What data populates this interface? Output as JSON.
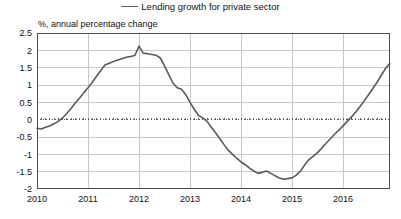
{
  "legend": {
    "swatch_name": "legend-line-swatch",
    "label": "Lending growth for private sector",
    "line_color": "#5a5a5a"
  },
  "axis_subtitle": "%, annual percentage change",
  "colors": {
    "series": "#5a5a5a",
    "grid": "#c8c8c8",
    "frame": "#4d4d4d",
    "zero_line": "#555555",
    "text": "#111111",
    "background": "#ffffff"
  },
  "chart_data": {
    "type": "line",
    "title": "",
    "subtitle": "%, annual percentage change",
    "xlabel": "",
    "ylabel": "%, annual percentage change",
    "ylim": [
      -2,
      2.5
    ],
    "xlim": [
      2010,
      2016.92
    ],
    "ytick_labels": [
      "2.5",
      "2",
      "1.5",
      "1",
      "0.5",
      "0",
      "-0.5",
      "-1",
      "-1.5",
      "-2"
    ],
    "yticks": [
      2.5,
      2,
      1.5,
      1,
      0.5,
      0,
      -0.5,
      -1,
      -1.5,
      -2
    ],
    "xtick_labels": [
      "2010",
      "2011",
      "2012",
      "2013",
      "2014",
      "2015",
      "2016"
    ],
    "xticks": [
      2010,
      2011,
      2012,
      2013,
      2014,
      2015,
      2016
    ],
    "grid": true,
    "zero_line": true,
    "zero_line_style": "dotted",
    "legend_position": "top-center",
    "series": [
      {
        "name": "Lending growth for private sector",
        "color": "#5a5a5a",
        "x": [
          2010.0,
          2010.083,
          2010.167,
          2010.25,
          2010.333,
          2010.417,
          2010.5,
          2010.583,
          2010.667,
          2010.75,
          2010.833,
          2010.917,
          2011.0,
          2011.083,
          2011.167,
          2011.25,
          2011.333,
          2011.417,
          2011.5,
          2011.583,
          2011.667,
          2011.75,
          2011.833,
          2011.917,
          2012.0,
          2012.083,
          2012.167,
          2012.25,
          2012.333,
          2012.417,
          2012.5,
          2012.583,
          2012.667,
          2012.75,
          2012.833,
          2012.917,
          2013.0,
          2013.083,
          2013.167,
          2013.25,
          2013.333,
          2013.417,
          2013.5,
          2013.583,
          2013.667,
          2013.75,
          2013.833,
          2013.917,
          2014.0,
          2014.083,
          2014.167,
          2014.25,
          2014.333,
          2014.417,
          2014.5,
          2014.583,
          2014.667,
          2014.75,
          2014.833,
          2014.917,
          2015.0,
          2015.083,
          2015.167,
          2015.25,
          2015.333,
          2015.417,
          2015.5,
          2015.583,
          2015.667,
          2015.75,
          2015.833,
          2015.917,
          2016.0,
          2016.083,
          2016.167,
          2016.25,
          2016.333,
          2016.417,
          2016.5,
          2016.583,
          2016.667,
          2016.75,
          2016.833,
          2016.917
        ],
        "values": [
          -0.25,
          -0.27,
          -0.22,
          -0.18,
          -0.12,
          -0.05,
          0.05,
          0.18,
          0.32,
          0.48,
          0.62,
          0.78,
          0.92,
          1.08,
          1.25,
          1.42,
          1.58,
          1.63,
          1.68,
          1.72,
          1.76,
          1.8,
          1.82,
          1.85,
          2.12,
          1.92,
          1.9,
          1.88,
          1.86,
          1.78,
          1.55,
          1.3,
          1.05,
          0.92,
          0.88,
          0.72,
          0.5,
          0.3,
          0.12,
          0.05,
          -0.05,
          -0.22,
          -0.38,
          -0.55,
          -0.72,
          -0.88,
          -1.0,
          -1.12,
          -1.22,
          -1.3,
          -1.4,
          -1.48,
          -1.55,
          -1.52,
          -1.48,
          -1.55,
          -1.62,
          -1.68,
          -1.72,
          -1.7,
          -1.68,
          -1.6,
          -1.48,
          -1.3,
          -1.15,
          -1.05,
          -0.95,
          -0.82,
          -0.68,
          -0.55,
          -0.42,
          -0.3,
          -0.18,
          -0.05,
          0.08,
          0.22,
          0.38,
          0.55,
          0.72,
          0.9,
          1.08,
          1.28,
          1.48,
          1.62
        ]
      }
    ]
  },
  "plot_geometry": {
    "left": 37,
    "right": 390,
    "top": 33,
    "bottom": 189
  }
}
